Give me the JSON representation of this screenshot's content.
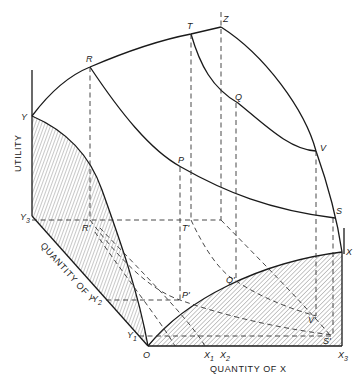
{
  "axes": {
    "utility_label": "UTILITY",
    "quantity_y_label": "QUANTITY OF Y",
    "quantity_x_label": "QUANTITY OF X"
  },
  "points": {
    "Y": "Y",
    "Y1": "Y",
    "Y1_sub": "1",
    "Y2": "Y",
    "Y2_sub": "2",
    "Y3": "Y",
    "Y3_sub": "3",
    "O": "O",
    "X": "X",
    "X1": "X",
    "X1_sub": "1",
    "X2": "X",
    "X2_sub": "2",
    "X3": "X",
    "X3_sub": "3",
    "R": "R",
    "T": "T",
    "Z": "Z",
    "Q": "Q",
    "P": "P",
    "V": "V",
    "S": "S",
    "R_prime": "R'",
    "T_prime": "T'",
    "P_prime": "P'",
    "Q_prime": "Q'",
    "V_prime": "V'",
    "S_prime": "S'"
  },
  "colors": {
    "ink": "#1a1a1a",
    "background": "#ffffff"
  }
}
